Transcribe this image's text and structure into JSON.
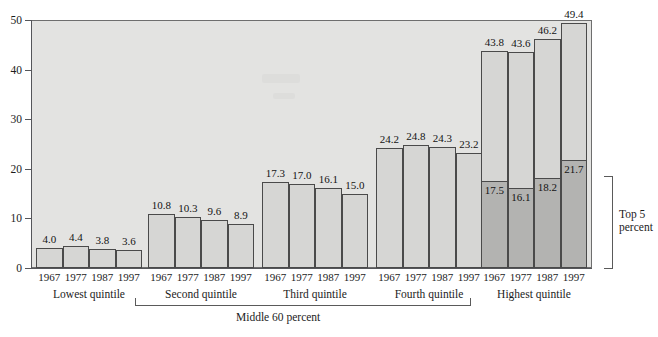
{
  "chart_data": {
    "type": "bar",
    "title": "",
    "subtitle": "",
    "xlabel": "",
    "ylabel": "",
    "ylim": [
      0,
      50
    ],
    "yticks": [
      0,
      10,
      20,
      30,
      40,
      50
    ],
    "grid": false,
    "legend_position": "none",
    "categories": [
      "1967",
      "1977",
      "1987",
      "1997"
    ],
    "groups": [
      {
        "name": "Lowest quintile",
        "values": [
          4.0,
          4.4,
          3.8,
          3.6
        ],
        "value_labels": [
          "4.0",
          "4.4",
          "3.8",
          "3.6"
        ],
        "stacked": false
      },
      {
        "name": "Second quintile",
        "values": [
          10.8,
          10.3,
          9.6,
          8.9
        ],
        "value_labels": [
          "10.8",
          "10.3",
          "9.6",
          "8.9"
        ],
        "stacked": false
      },
      {
        "name": "Third quintile",
        "values": [
          17.3,
          17.0,
          16.1,
          15.0
        ],
        "value_labels": [
          "17.3",
          "17.0",
          "16.1",
          "15.0"
        ],
        "stacked": false
      },
      {
        "name": "Fourth quintile",
        "values": [
          24.2,
          24.8,
          24.3,
          23.2
        ],
        "value_labels": [
          "24.2",
          "24.8",
          "24.3",
          "23.2"
        ],
        "stacked": false
      },
      {
        "name": "Highest quintile",
        "values": [
          43.8,
          43.6,
          46.2,
          49.4
        ],
        "value_labels": [
          "43.8",
          "43.6",
          "46.2",
          "49.4"
        ],
        "stacked": true,
        "inner_series_name": "Top 5 percent",
        "inner_values": [
          17.5,
          16.1,
          18.2,
          21.7
        ],
        "inner_value_labels": [
          "17.5",
          "16.1",
          "18.2",
          "21.7"
        ]
      }
    ],
    "annotations": [
      {
        "text": "Middle 60 percent",
        "spans": [
          "Second quintile",
          "Third quintile",
          "Fourth quintile"
        ],
        "orientation": "horizontal"
      },
      {
        "text": "Top 5 percent",
        "spans": [
          "Highest quintile"
        ],
        "orientation": "vertical"
      }
    ],
    "colors": {
      "plot_background": "#e3e3e1",
      "bar_fill": "#d6d6d4",
      "bar_inner_fill": "#b3b3b1",
      "bar_stroke": "#4a4a4a",
      "axis": "#55565a",
      "text": "#1c1c1c",
      "page_background": "#ffffff"
    }
  }
}
